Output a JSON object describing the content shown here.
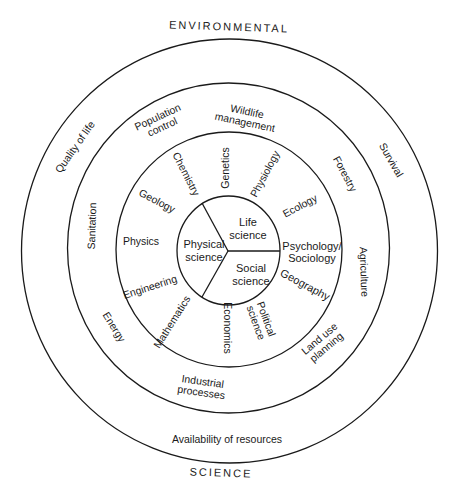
{
  "diagram": {
    "outer_label_top": "ENVIRONMENTAL",
    "outer_label_bottom": "SCIENCE",
    "colors": {
      "ink": "#1a1a1a",
      "background": "#ffffff"
    },
    "core": [
      {
        "label": "Life\nscience",
        "x": 248,
        "y": 229
      },
      {
        "label": "Physical\nscience",
        "x": 204,
        "y": 251
      },
      {
        "label": "Social\nscience",
        "x": 251,
        "y": 275
      }
    ],
    "ring_disciplines": [
      {
        "label": "Genetics",
        "x": 225,
        "y": 168,
        "rot": -90
      },
      {
        "label": "Chemistry",
        "x": 186,
        "y": 174,
        "rot": 63
      },
      {
        "label": "Physiology",
        "x": 265,
        "y": 174,
        "rot": -62
      },
      {
        "label": "Geology",
        "x": 157,
        "y": 201,
        "rot": 28
      },
      {
        "label": "Ecology",
        "x": 300,
        "y": 206,
        "rot": -28
      },
      {
        "label": "Physics",
        "x": 141,
        "y": 241,
        "rot": 0
      },
      {
        "label": "Psychology/\nSociology",
        "x": 312,
        "y": 252,
        "rot": 0
      },
      {
        "label": "Engineering",
        "x": 150,
        "y": 287,
        "rot": -18
      },
      {
        "label": "Geography",
        "x": 305,
        "y": 285,
        "rot": 28
      },
      {
        "label": "Mathematics",
        "x": 172,
        "y": 322,
        "rot": -58
      },
      {
        "label": "Economics",
        "x": 227,
        "y": 328,
        "rot": 90
      },
      {
        "label": "Political\nscience",
        "x": 261,
        "y": 321,
        "rot": 70
      }
    ],
    "ring_applications": [
      {
        "label": "Wildlife\nmanagement",
        "x": 246,
        "y": 117,
        "rot": 12
      },
      {
        "label": "Population\ncontrol",
        "x": 160,
        "y": 122,
        "rot": -25
      },
      {
        "label": "Forestry",
        "x": 345,
        "y": 174,
        "rot": 62
      },
      {
        "label": "Sanitation",
        "x": 92,
        "y": 226,
        "rot": -88
      },
      {
        "label": "Agriculture",
        "x": 364,
        "y": 272,
        "rot": 88
      },
      {
        "label": "Energy",
        "x": 114,
        "y": 327,
        "rot": 58
      },
      {
        "label": "Land use\nplanning",
        "x": 323,
        "y": 343,
        "rot": -40
      },
      {
        "label": "Industrial\nprocesses",
        "x": 202,
        "y": 387,
        "rot": 8
      }
    ],
    "ring_concerns": [
      {
        "label": "Quality of life",
        "x": 75,
        "y": 147,
        "rot": -55
      },
      {
        "label": "Survival",
        "x": 391,
        "y": 160,
        "rot": 60
      },
      {
        "label": "Availability of resources",
        "x": 227,
        "y": 439,
        "rot": 0
      }
    ],
    "geometry": {
      "center": {
        "x": 229,
        "y": 251
      },
      "radii": {
        "outer": {
          "rx": 208,
          "ry": 212
        },
        "middle": {
          "rx": 161,
          "ry": 165
        },
        "inner": {
          "rx": 113,
          "ry": 117
        },
        "core": {
          "rx": 52,
          "ry": 54
        }
      }
    }
  }
}
